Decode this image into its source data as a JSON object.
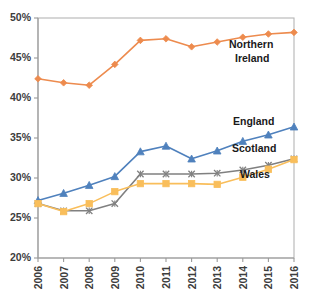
{
  "chart_data": {
    "type": "line",
    "title": "",
    "xlabel": "",
    "ylabel": "",
    "grid": false,
    "legend_position": "inline-right",
    "categories": [
      "2006",
      "2007",
      "2008",
      "2009",
      "2010",
      "2011",
      "2012",
      "2013",
      "2014",
      "2015",
      "2016"
    ],
    "ylim": [
      20,
      50
    ],
    "ytick_values": [
      20,
      25,
      30,
      35,
      40,
      45,
      50
    ],
    "ytick_labels": [
      "20%",
      "25%",
      "30%",
      "35%",
      "40%",
      "45%",
      "50%"
    ],
    "series": [
      {
        "name": "Northern Ireland",
        "color": "#ED8B4E",
        "marker": "diamond",
        "values": [
          42.4,
          41.9,
          41.6,
          44.2,
          47.2,
          47.4,
          46.4,
          47.0,
          47.6,
          48.0,
          48.2
        ]
      },
      {
        "name": "England",
        "color": "#4F81BD",
        "marker": "triangle",
        "values": [
          27.2,
          28.1,
          29.1,
          30.2,
          33.3,
          34.0,
          32.4,
          33.4,
          34.6,
          35.4,
          36.4
        ]
      },
      {
        "name": "Scotland",
        "color": "#808080",
        "marker": "cross",
        "values": [
          26.8,
          25.9,
          25.9,
          26.8,
          30.5,
          30.5,
          30.5,
          30.6,
          31.0,
          31.6,
          32.4
        ]
      },
      {
        "name": "Wales",
        "color": "#F9BE5B",
        "marker": "square",
        "values": [
          26.8,
          25.8,
          26.8,
          28.3,
          29.3,
          29.3,
          29.3,
          29.2,
          30.1,
          31.1,
          32.3
        ]
      }
    ],
    "inline_labels": [
      {
        "text": "Northern",
        "x": 229,
        "y": 48
      },
      {
        "text": "Ireland",
        "x": 235,
        "y": 62
      },
      {
        "text": "England",
        "x": 233,
        "y": 125
      },
      {
        "text": "Scotland",
        "x": 232,
        "y": 152
      },
      {
        "text": "Wales",
        "x": 240,
        "y": 178
      }
    ]
  },
  "axes": {
    "y_labels": [
      "50%",
      "45%",
      "40%",
      "35%",
      "30%",
      "25%",
      "20%"
    ],
    "x_labels": [
      "2006",
      "2007",
      "2008",
      "2009",
      "2010",
      "2011",
      "2012",
      "2013",
      "2014",
      "2015",
      "2016"
    ]
  }
}
